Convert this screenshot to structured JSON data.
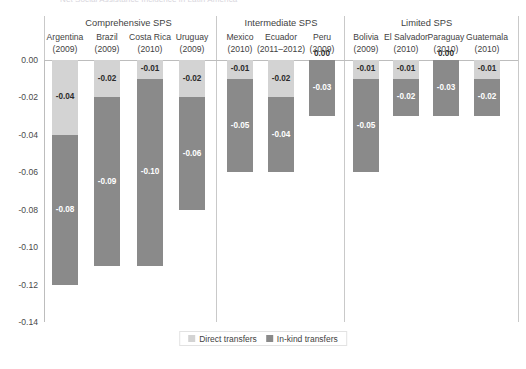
{
  "title_clipped": "Net Social Assistance Incidence in Latin America",
  "chart_data": {
    "type": "bar",
    "subtype": "stacked-bar-negative",
    "title": "Net Social Assistance Incidence in Latin America",
    "xlabel": "",
    "ylabel": "",
    "ylim": [
      -0.14,
      0.0
    ],
    "grid": false,
    "legend_position": "bottom-center",
    "yticks": [
      "0.00",
      "-0.02",
      "-0.04",
      "-0.06",
      "-0.08",
      "-0.10",
      "-0.12",
      "-0.14"
    ],
    "ytick_values": [
      0.0,
      -0.02,
      -0.04,
      -0.06,
      -0.08,
      -0.1,
      -0.12,
      -0.14
    ],
    "groups": [
      {
        "label": "Comprehensive SPS",
        "count": 4
      },
      {
        "label": "Intermediate SPS",
        "count": 3
      },
      {
        "label": "Limited SPS",
        "count": 4
      }
    ],
    "categories": [
      "Argentina",
      "Brazil",
      "Costa Rica",
      "Uruguay",
      "Mexico",
      "Ecuador",
      "Peru",
      "Bolivia",
      "El Salvador",
      "Paraguay",
      "Guatemala"
    ],
    "category_years": [
      "(2009)",
      "(2009)",
      "(2010)",
      "(2009)",
      "(2010)",
      "(2011–2012)",
      "(2009)",
      "(2009)",
      "(2010)",
      "(2010)",
      "(2010)"
    ],
    "series": [
      {
        "name": "Direct transfers",
        "color": "#d3d3d3",
        "values": [
          -0.04,
          -0.02,
          -0.01,
          -0.02,
          -0.01,
          -0.02,
          0.0,
          -0.01,
          -0.01,
          0.0,
          -0.01
        ],
        "labels": [
          "-0.04",
          "-0.02",
          "-0.01",
          "-0.02",
          "-0.01",
          "-0.02",
          "0.00",
          "-0.01",
          "-0.01",
          "0.00",
          "-0.01"
        ]
      },
      {
        "name": "In-kind transfers",
        "color": "#8a8a8a",
        "values": [
          -0.08,
          -0.09,
          -0.1,
          -0.06,
          -0.05,
          -0.04,
          -0.03,
          -0.05,
          -0.02,
          -0.03,
          -0.02
        ],
        "labels": [
          "-0.08",
          "-0.09",
          "-0.10",
          "-0.06",
          "-0.05",
          "-0.04",
          "-0.03",
          "-0.05",
          "-0.02",
          "-0.03",
          "-0.02"
        ]
      }
    ],
    "totals": [
      -0.12,
      -0.11,
      -0.11,
      -0.08,
      -0.06,
      -0.06,
      -0.03,
      -0.06,
      -0.03,
      -0.03,
      -0.03
    ]
  },
  "legend": {
    "items": [
      {
        "label": "Direct transfers",
        "color": "#d3d3d3"
      },
      {
        "label": "In-kind transfers",
        "color": "#8a8a8a"
      }
    ]
  },
  "colors": {
    "direct_transfers": "#d3d3d3",
    "in_kind_transfers": "#8a8a8a",
    "axis": "#bdbdbd",
    "separator": "#c9c9c9",
    "text": "#3f3f3f",
    "background": "#ffffff"
  }
}
